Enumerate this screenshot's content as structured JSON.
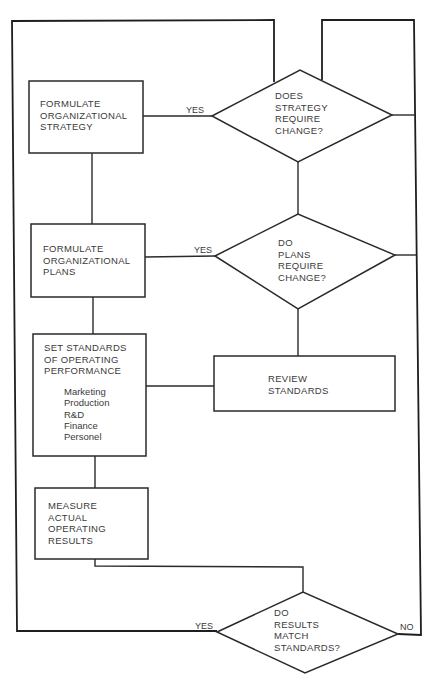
{
  "flowchart": {
    "boxes": {
      "strategy": "FORMULATE\nORGANIZATIONAL\nSTRATEGY",
      "plans": "FORMULATE\nORGANIZATIONAL\nPLANS",
      "standards": "SET STANDARDS\nOF OPERATING\nPERFORMANCE",
      "standards_areas": "Marketing\nProduction\nR&D\nFinance\nPersonel",
      "measure": "MEASURE\nACTUAL\nOPERATING\nRESULTS",
      "review": "REVIEW\nSTANDARDS"
    },
    "decisions": {
      "strategy_change": "DOES\nSTRATEGY\nREQUIRE\nCHANGE?",
      "plans_change": "DO\nPLANS\nREQUIRE\nCHANGE?",
      "results_match": "DO\nRESULTS\nMATCH\nSTANDARDS?"
    },
    "labels": {
      "yes_strategy": "YES",
      "yes_plans": "YES",
      "yes_results": "YES",
      "no_results": "NO"
    },
    "colors": {
      "line": "#2a2a2a",
      "text": "#3a3a3a",
      "background": "#ffffff"
    }
  }
}
